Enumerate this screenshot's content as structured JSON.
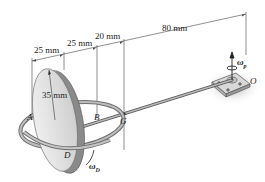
{
  "diagram": {
    "type": "engineering-mechanics gyroscope figure",
    "dimensions": [
      {
        "id": "d1",
        "label": "25 mm"
      },
      {
        "id": "d2",
        "label": "25 mm"
      },
      {
        "id": "d3",
        "label": "20 mm"
      },
      {
        "id": "d4",
        "label": "80 mm"
      }
    ],
    "radius_label": "35 mm",
    "points": {
      "A": "A",
      "B": "B",
      "G": "G",
      "O": "O",
      "D": "D"
    },
    "angular_velocities": {
      "precession_symbol": "ω",
      "precession_sub": "p",
      "disk_symbol": "ω",
      "disk_sub": "D"
    },
    "colors": {
      "disk_face": "#dcdcdc",
      "disk_rim": "#8a8a8a",
      "ring": "#9a9a9a",
      "shaft": "#7a7a7a",
      "line": "#333333",
      "shadow": "#bdbdbd"
    }
  }
}
